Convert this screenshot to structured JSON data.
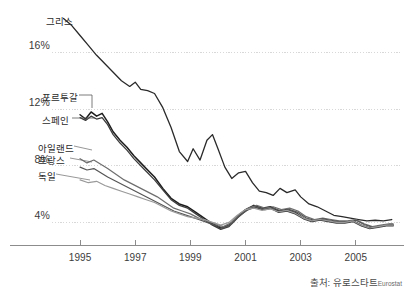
{
  "chart_data": {
    "type": "line",
    "title": "",
    "subtitle": "",
    "xlabel": "",
    "ylabel": "",
    "xlim": [
      1994.2,
      2006.6
    ],
    "ylim": [
      2.4,
      19.0
    ],
    "grid": true,
    "legend_position": "inline-left-labels",
    "y_ticks": [
      "4%",
      "8%",
      "12%",
      "16%"
    ],
    "y_tick_values": [
      4,
      8,
      12,
      16
    ],
    "x_ticks": [
      "1995",
      "1997",
      "1999",
      "2001",
      "2003",
      "2005"
    ],
    "x_tick_values": [
      1995,
      1997,
      1999,
      2001,
      2003,
      2005
    ],
    "annotations": [
      "출처: 유로스타트",
      "Eurostat"
    ],
    "series": [
      {
        "name": "그리스",
        "label": "그리스",
        "color": "#2a2a2a",
        "width": 1.3,
        "x": [
          1994.4,
          1994.7,
          1995.0,
          1995.3,
          1995.6,
          1995.9,
          1996.2,
          1996.5,
          1996.8,
          1997.0,
          1997.2,
          1997.45,
          1997.7,
          1998.0,
          1998.3,
          1998.6,
          1998.9,
          1999.1,
          1999.35,
          1999.6,
          1999.8,
          2000.0,
          2000.25,
          2000.5,
          2000.75,
          2001.0,
          2001.25,
          2001.5,
          2001.75,
          2002.0,
          2002.25,
          2002.5,
          2002.8,
          2003.0,
          2003.3,
          2003.6,
          2003.9,
          2004.2,
          2004.5,
          2004.8,
          2005.1,
          2005.4,
          2005.7,
          2006.0,
          2006.3
        ],
        "values": [
          18.4,
          17.9,
          17.2,
          16.5,
          15.8,
          15.2,
          14.6,
          14.0,
          13.6,
          13.9,
          13.4,
          13.3,
          13.1,
          12.1,
          10.7,
          9.0,
          8.3,
          9.2,
          8.4,
          9.8,
          10.2,
          9.2,
          7.9,
          7.1,
          7.5,
          7.6,
          6.8,
          6.2,
          6.1,
          5.9,
          6.4,
          6.1,
          6.3,
          5.8,
          5.3,
          5.1,
          4.8,
          4.5,
          4.4,
          4.3,
          4.2,
          4.1,
          4.15,
          4.1,
          4.2
        ]
      },
      {
        "name": "포르투갈",
        "label": "포르투갈",
        "color": "#1d1d1d",
        "width": 1.5,
        "x": [
          1995.0,
          1995.2,
          1995.4,
          1995.6,
          1995.8,
          1996.0,
          1996.2,
          1996.45,
          1996.7,
          1996.95,
          1997.2,
          1997.45,
          1997.7,
          1998.0,
          1998.3,
          1998.6,
          1998.9,
          1999.2,
          1999.5,
          1999.8,
          2000.1,
          2000.4,
          2000.7,
          2001.0,
          2001.3,
          2001.6,
          2001.9,
          2002.2,
          2002.5,
          2002.8,
          2003.1,
          2003.4,
          2003.7,
          2004.0,
          2004.3,
          2004.6,
          2004.9,
          2005.2,
          2005.5,
          2005.8,
          2006.1,
          2006.35
        ],
        "values": [
          11.6,
          11.3,
          11.8,
          11.5,
          11.7,
          11.1,
          10.4,
          9.8,
          9.3,
          8.7,
          8.2,
          7.7,
          7.2,
          6.4,
          5.7,
          5.3,
          5.1,
          4.7,
          4.3,
          3.9,
          3.6,
          3.8,
          4.4,
          4.9,
          5.2,
          5.0,
          5.1,
          4.8,
          4.9,
          4.7,
          4.3,
          4.1,
          4.2,
          4.1,
          4.0,
          4.0,
          4.1,
          3.8,
          3.6,
          3.7,
          3.8,
          3.8
        ]
      },
      {
        "name": "스페인",
        "label": "스페인",
        "color": "#3c3c3c",
        "width": 1.3,
        "x": [
          1995.0,
          1995.2,
          1995.4,
          1995.6,
          1995.8,
          1996.0,
          1996.2,
          1996.45,
          1996.7,
          1996.95,
          1997.2,
          1997.45,
          1997.7,
          1998.0,
          1998.3,
          1998.6,
          1998.9,
          1999.2,
          1999.5,
          1999.8,
          2000.1,
          2000.4,
          2000.7,
          2001.0,
          2001.3,
          2001.6,
          2001.9,
          2002.2,
          2002.5,
          2002.8,
          2003.1,
          2003.4,
          2003.7,
          2004.0,
          2004.3,
          2004.6,
          2004.9,
          2005.2,
          2005.5,
          2005.8,
          2006.1,
          2006.35
        ],
        "values": [
          11.4,
          11.2,
          11.5,
          11.3,
          11.4,
          10.9,
          10.2,
          9.6,
          9.1,
          8.5,
          8.0,
          7.5,
          7.0,
          6.3,
          5.6,
          5.2,
          5.0,
          4.6,
          4.2,
          3.8,
          3.5,
          3.7,
          4.3,
          4.8,
          5.1,
          4.9,
          5.0,
          4.7,
          4.8,
          4.6,
          4.25,
          4.05,
          4.15,
          4.05,
          3.95,
          3.95,
          4.05,
          3.75,
          3.55,
          3.65,
          3.75,
          3.75
        ]
      },
      {
        "name": "아일랜드",
        "label": "아일랜드",
        "color": "#6e6e6e",
        "width": 1.2,
        "x": [
          1995.0,
          1995.25,
          1995.5,
          1995.75,
          1996.0,
          1996.3,
          1996.6,
          1996.9,
          1997.2,
          1997.5,
          1997.8,
          1998.1,
          1998.4,
          1998.7,
          1999.0,
          1999.3,
          1999.6,
          1999.9,
          2000.2,
          2000.5,
          2000.8,
          2001.1,
          2001.4,
          2001.7,
          2002.0,
          2002.3,
          2002.6,
          2002.9,
          2003.2,
          2003.5,
          2003.8,
          2004.1,
          2004.4,
          2004.7,
          2005.0,
          2005.3,
          2005.6,
          2005.9,
          2006.2,
          2006.35
        ],
        "values": [
          8.5,
          8.2,
          8.4,
          8.1,
          7.8,
          7.4,
          7.0,
          6.7,
          6.4,
          6.1,
          5.8,
          5.4,
          5.0,
          4.8,
          4.6,
          4.3,
          4.1,
          3.9,
          3.7,
          4.0,
          4.6,
          5.0,
          5.2,
          5.0,
          5.1,
          4.9,
          5.0,
          4.8,
          4.4,
          4.2,
          4.3,
          4.2,
          4.1,
          4.1,
          4.2,
          3.9,
          3.7,
          3.8,
          3.9,
          3.9
        ]
      },
      {
        "name": "프랑스",
        "label": "프랑스",
        "color": "#555555",
        "width": 1.2,
        "x": [
          1995.0,
          1995.25,
          1995.5,
          1995.75,
          1996.0,
          1996.3,
          1996.6,
          1996.9,
          1997.2,
          1997.5,
          1997.8,
          1998.1,
          1998.4,
          1998.7,
          1999.0,
          1999.3,
          1999.6,
          1999.9,
          2000.2,
          2000.5,
          2000.8,
          2001.1,
          2001.4,
          2001.7,
          2002.0,
          2002.3,
          2002.6,
          2002.9,
          2003.2,
          2003.5,
          2003.8,
          2004.1,
          2004.4,
          2004.7,
          2005.0,
          2005.3,
          2005.6,
          2005.9,
          2006.2,
          2006.35
        ],
        "values": [
          7.9,
          7.7,
          7.8,
          7.5,
          7.2,
          6.9,
          6.6,
          6.3,
          6.0,
          5.7,
          5.4,
          5.1,
          4.8,
          4.6,
          4.4,
          4.2,
          4.0,
          3.8,
          3.6,
          3.9,
          4.5,
          4.9,
          5.1,
          4.9,
          5.0,
          4.8,
          4.9,
          4.7,
          4.3,
          4.15,
          4.25,
          4.15,
          4.05,
          4.05,
          4.15,
          3.85,
          3.65,
          3.75,
          3.85,
          3.85
        ]
      },
      {
        "name": "독일",
        "label": "독일",
        "color": "#9a9a9a",
        "width": 1.2,
        "x": [
          1995.0,
          1995.3,
          1995.6,
          1995.9,
          1996.2,
          1996.5,
          1996.8,
          1997.1,
          1997.4,
          1997.7,
          1998.0,
          1998.3,
          1998.6,
          1998.9,
          1999.2,
          1999.5,
          1999.8,
          2000.1,
          2000.4,
          2000.7,
          2001.0,
          2001.3,
          2001.6,
          2001.9,
          2002.2,
          2002.5,
          2002.8,
          2003.1,
          2003.4,
          2003.7,
          2004.0,
          2004.3,
          2004.6,
          2004.9,
          2005.2,
          2005.5,
          2005.8,
          2006.1,
          2006.35
        ],
        "values": [
          7.0,
          6.8,
          6.9,
          6.6,
          6.4,
          6.2,
          6.0,
          5.8,
          5.6,
          5.4,
          5.1,
          4.8,
          4.6,
          4.4,
          4.3,
          4.2,
          4.0,
          3.8,
          4.0,
          4.5,
          4.9,
          5.0,
          4.85,
          4.95,
          4.75,
          4.85,
          4.65,
          4.3,
          4.1,
          4.2,
          4.1,
          4.0,
          4.0,
          4.1,
          3.8,
          3.6,
          3.7,
          3.8,
          3.8
        ]
      }
    ]
  },
  "axis": {
    "y_ticks": [
      {
        "label": "16%",
        "value": 16
      },
      {
        "label": "12%",
        "value": 12
      },
      {
        "label": "8%",
        "value": 8
      },
      {
        "label": "4%",
        "value": 4
      }
    ],
    "x_ticks": [
      {
        "label": "1995",
        "value": 1995
      },
      {
        "label": "1997",
        "value": 1997
      },
      {
        "label": "1999",
        "value": 1999
      },
      {
        "label": "2001",
        "value": 2001
      },
      {
        "label": "2003",
        "value": 2003
      },
      {
        "label": "2005",
        "value": 2005
      }
    ]
  },
  "series_labels": [
    {
      "name": "greece",
      "text": "그리스",
      "left": 46,
      "top": 14,
      "leader": null
    },
    {
      "name": "portugal",
      "text": "포르투갈",
      "left": 42,
      "top": 90,
      "leader": {
        "x1": 79,
        "y1": 95,
        "x2": 92,
        "y2": 95,
        "x3": 92,
        "y3": 108
      }
    },
    {
      "name": "spain",
      "text": "스페인",
      "left": 42,
      "top": 113,
      "leader": {
        "x1": 72,
        "y1": 118,
        "x2": 95,
        "y2": 118,
        "x3": 95,
        "y3": 118
      }
    },
    {
      "name": "ireland",
      "text": "아일랜드",
      "left": 38,
      "top": 141,
      "leader": null
    },
    {
      "name": "france",
      "text": "프랑스",
      "left": 38,
      "top": 153,
      "leader": null
    },
    {
      "name": "germany",
      "text": "독일",
      "left": 38,
      "top": 169,
      "leader": null
    }
  ],
  "source": {
    "prefix": "출처: 유로스타트",
    "suffix": "Eurostat"
  },
  "colors": {
    "background": "#ffffff",
    "grid": "#d8d8d8",
    "axis": "#8c8c8c",
    "text": "#2b2b2b"
  }
}
